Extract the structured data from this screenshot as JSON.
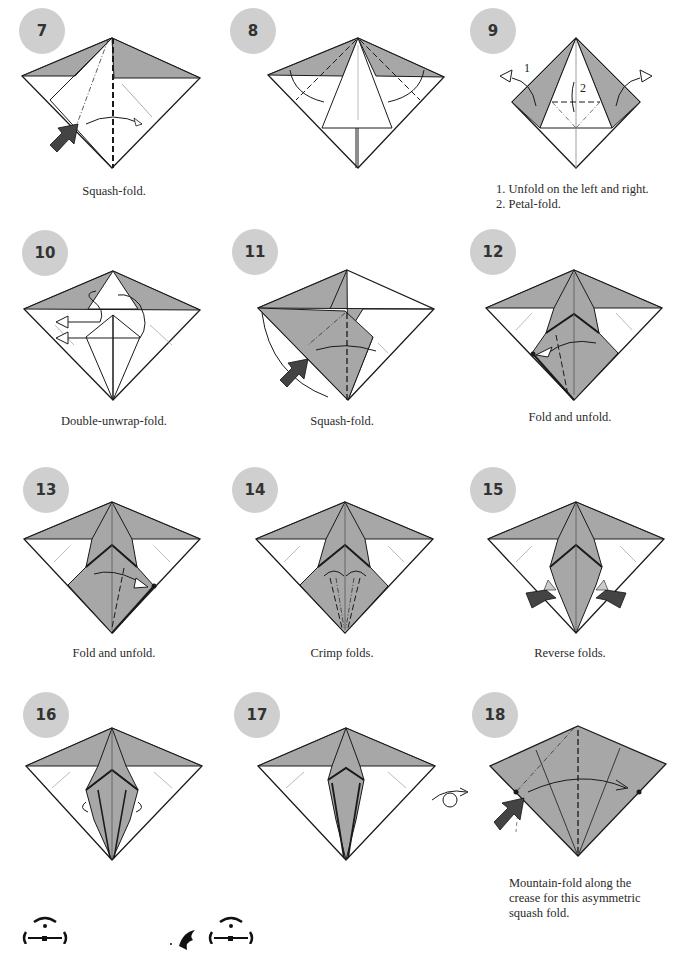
{
  "colors": {
    "paper_gray": "#a7a7a7",
    "badge_gray": "#cfcfcf",
    "line": "#1a1a1a"
  },
  "steps": [
    {
      "number": "7",
      "caption": "Squash-fold."
    },
    {
      "number": "8",
      "caption": ""
    },
    {
      "number": "9",
      "caption_lines": [
        "1. Unfold on the left and right.",
        "2. Petal-fold."
      ],
      "labels": [
        "1",
        "2"
      ]
    },
    {
      "number": "10",
      "caption": "Double-unwrap-fold."
    },
    {
      "number": "11",
      "caption": "Squash-fold."
    },
    {
      "number": "12",
      "caption": "Fold and unfold."
    },
    {
      "number": "13",
      "caption": "Fold and unfold."
    },
    {
      "number": "14",
      "caption": "Crimp folds."
    },
    {
      "number": "15",
      "caption": "Reverse folds."
    },
    {
      "number": "16",
      "caption": ""
    },
    {
      "number": "17",
      "caption": ""
    },
    {
      "number": "18",
      "caption_lines": [
        "Mountain-fold along the",
        "crease for this asymmetric",
        "squash fold."
      ]
    }
  ],
  "icons": [
    "push-arrow-icon",
    "turn-over-icon",
    "ornament-icon",
    "bird-ornament-icon"
  ]
}
